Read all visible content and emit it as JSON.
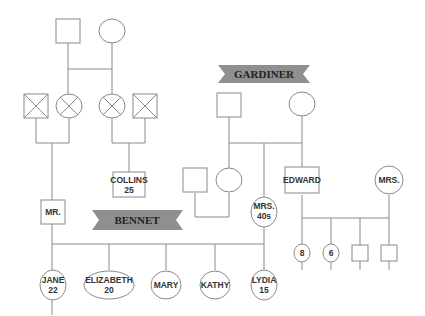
{
  "families": {
    "gardiner": {
      "label": "GARDINER"
    },
    "bennet": {
      "label": "BENNET"
    }
  },
  "people": {
    "collins": {
      "name": "COLLINS",
      "age": "25"
    },
    "mr_bennet": {
      "name": "MR."
    },
    "mrs_bennet": {
      "name": "MRS.",
      "age": "40s"
    },
    "edward": {
      "name": "EDWARD"
    },
    "mrs_gardiner": {
      "name": "MRS."
    },
    "jane": {
      "name": "JANE",
      "age": "22"
    },
    "elizabeth": {
      "name": "ELIZABETH",
      "age": "20"
    },
    "mary": {
      "name": "MARY"
    },
    "kathy": {
      "name": "KATHY"
    },
    "lydia": {
      "name": "LYDIA",
      "age": "15"
    },
    "gardiner_child_1": {
      "age": "8"
    },
    "gardiner_child_2": {
      "age": "6"
    }
  },
  "legend": {
    "square": "male",
    "circle": "female",
    "crossed": "deceased"
  }
}
